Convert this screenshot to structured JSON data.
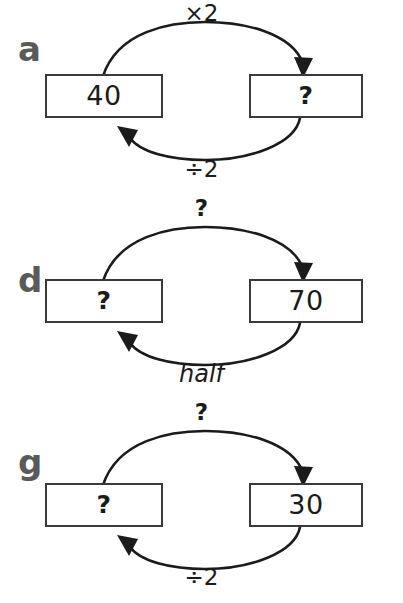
{
  "page": {
    "background_color": "#ffffff",
    "ink_color": "#1b1b1b",
    "letter_color": "#5a5a5a",
    "box_border_color": "#3a3a3a"
  },
  "sections": [
    {
      "id": "a",
      "letter": "a",
      "left_box": {
        "value": "40"
      },
      "right_box": {
        "value": "?"
      },
      "top_arrow": {
        "label": "×2",
        "direction": "left-to-right"
      },
      "bottom_arrow": {
        "label": "÷2",
        "direction": "right-to-left"
      }
    },
    {
      "id": "d",
      "letter": "d",
      "left_box": {
        "value": "?"
      },
      "right_box": {
        "value": "70"
      },
      "top_arrow": {
        "label": "?",
        "direction": "left-to-right"
      },
      "bottom_arrow": {
        "label": "half",
        "direction": "right-to-left",
        "style": "italic"
      }
    },
    {
      "id": "g",
      "letter": "g",
      "left_box": {
        "value": "?"
      },
      "right_box": {
        "value": "30"
      },
      "top_arrow": {
        "label": "?",
        "direction": "left-to-right"
      },
      "bottom_arrow": {
        "label": "÷2",
        "direction": "right-to-left"
      }
    }
  ]
}
